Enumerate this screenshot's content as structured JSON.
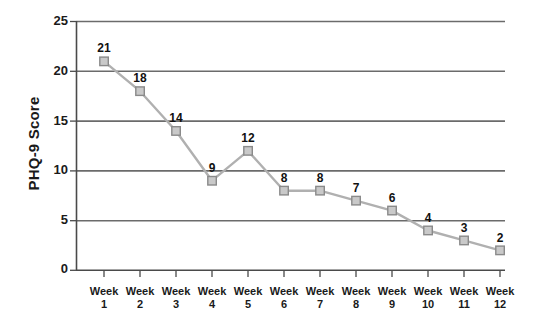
{
  "chart_data": {
    "type": "line",
    "title": "",
    "xlabel": "",
    "ylabel": "PHQ-9 Score",
    "categories": [
      "Week 1",
      "Week 2",
      "Week 3",
      "Week 4",
      "Week 5",
      "Week 6",
      "Week 7",
      "Week 8",
      "Week 9",
      "Week 10",
      "Week 11",
      "Week 12"
    ],
    "x_tick_prefix": "Week",
    "x_tick_numbers": [
      "1",
      "2",
      "3",
      "4",
      "5",
      "6",
      "7",
      "8",
      "9",
      "10",
      "11",
      "12"
    ],
    "values": [
      21,
      18,
      14,
      9,
      12,
      8,
      8,
      7,
      6,
      4,
      3,
      2
    ],
    "point_labels": [
      "21",
      "18",
      "14",
      "9",
      "12",
      "8",
      "8",
      "7",
      "6",
      "4",
      "3",
      "2"
    ],
    "ylim": [
      0,
      25
    ],
    "y_ticks": [
      0,
      5,
      10,
      15,
      20,
      25
    ],
    "y_tick_labels": [
      "0",
      "5",
      "10",
      "15",
      "20",
      "25"
    ],
    "grid": "horizontal",
    "legend": "none",
    "marker": "square",
    "series": [
      {
        "name": "PHQ-9 Score",
        "values": [
          21,
          18,
          14,
          9,
          12,
          8,
          8,
          7,
          6,
          4,
          3,
          2
        ]
      }
    ],
    "colors": {
      "line": "#b0b0b0",
      "marker_fill": "#c9c9c9",
      "marker_stroke": "#8a8a8a",
      "grid": "#6b6b6b",
      "axis": "#4a4a4a",
      "text": "#1a1a1a",
      "background": "#ffffff"
    }
  }
}
